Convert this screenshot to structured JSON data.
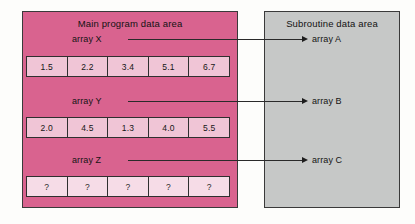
{
  "diagram": {
    "main_panel": {
      "title": "Main program data area",
      "fill_color": "#d9638f",
      "arrays": [
        {
          "label": "array X",
          "cells": [
            "1.5",
            "2.2",
            "3.4",
            "5.1",
            "6.7"
          ],
          "cell_fill": "#f0c5d6"
        },
        {
          "label": "array Y",
          "cells": [
            "2.0",
            "4.5",
            "1.3",
            "4.0",
            "5.5"
          ],
          "cell_fill": "#f0c5d6"
        },
        {
          "label": "array Z",
          "cells": [
            "?",
            "?",
            "?",
            "?",
            "?"
          ],
          "cell_fill": "#f6dce7"
        }
      ]
    },
    "subroutine_panel": {
      "title": "Subroutine data area",
      "fill_color": "#c6c8c7",
      "arrays": [
        {
          "label": "array A"
        },
        {
          "label": "array B"
        },
        {
          "label": "array C"
        }
      ]
    },
    "connectors": [
      {
        "from": "array X",
        "to": "array A",
        "icon": "arrow-right-icon"
      },
      {
        "from": "array Y",
        "to": "array B",
        "icon": "arrow-right-icon"
      },
      {
        "from": "array Z",
        "to": "array C",
        "icon": "arrow-right-icon"
      }
    ]
  }
}
